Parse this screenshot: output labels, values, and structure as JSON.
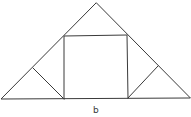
{
  "diagram": {
    "stroke_color": "#3a3a3a",
    "label": "b",
    "points": {
      "apex": [
        96,
        3
      ],
      "base_left": [
        1,
        99
      ],
      "base_right": [
        190,
        98
      ],
      "square_top_left": [
        64,
        36
      ],
      "square_top_right": [
        127,
        35
      ],
      "square_bottom_left": [
        64,
        99
      ],
      "square_bottom_right": [
        128,
        98
      ],
      "left_leg_point": [
        33,
        68
      ],
      "right_leg_point": [
        158,
        66
      ]
    }
  }
}
